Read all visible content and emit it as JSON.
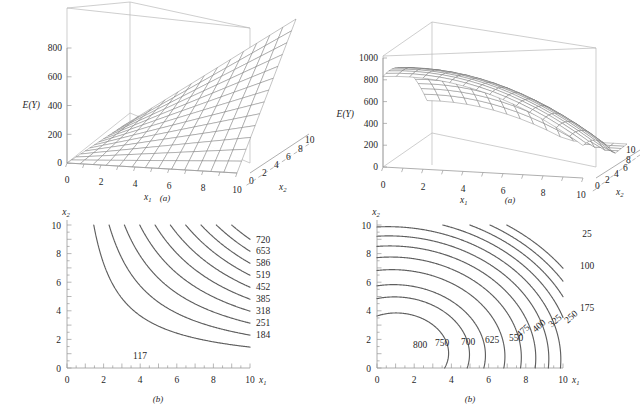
{
  "figure": {
    "panels": [
      {
        "id": "a-left",
        "caption": "(a)",
        "kind": "surface3d",
        "zlabel": "E(Y)",
        "xlabel": "x",
        "xlabel_sub": "1",
        "ylabel": "x",
        "ylabel_sub": "2",
        "zticks": [
          "0",
          "200",
          "400",
          "600",
          "800"
        ],
        "xticks": [
          "0",
          "2",
          "4",
          "6",
          "8",
          "10"
        ],
        "yticks": [
          "0",
          "2",
          "4",
          "6",
          "8",
          "10"
        ]
      },
      {
        "id": "a-right",
        "caption": "(a)",
        "kind": "surface3d",
        "zlabel": "E(Y)",
        "xlabel": "x",
        "xlabel_sub": "1",
        "ylabel": "x",
        "ylabel_sub": "2",
        "zticks": [
          "0",
          "200",
          "400",
          "600",
          "800",
          "1000"
        ],
        "xticks": [
          "0",
          "2",
          "4",
          "6",
          "8",
          "10"
        ],
        "yticks": [
          "0",
          "2",
          "4",
          "6",
          "8",
          "10"
        ]
      },
      {
        "id": "b-left",
        "caption": "(b)",
        "kind": "contour",
        "xlabel": "x",
        "xlabel_sub": "1",
        "ylabel": "x",
        "ylabel_sub": "2",
        "xticks": [
          "0",
          "2",
          "4",
          "6",
          "8",
          "10"
        ],
        "yticks": [
          "0",
          "2",
          "4",
          "6",
          "8",
          "10"
        ]
      },
      {
        "id": "b-right",
        "caption": "(b)",
        "kind": "contour",
        "xlabel": "x",
        "xlabel_sub": "1",
        "ylabel": "x",
        "ylabel_sub": "2",
        "xticks": [
          "0",
          "2",
          "4",
          "6",
          "8",
          "10"
        ],
        "yticks": [
          "0",
          "2",
          "4",
          "6",
          "8",
          "10"
        ]
      }
    ]
  },
  "chart_data": [
    {
      "id": "a-left",
      "type": "surface",
      "title": "",
      "xlabel": "x1",
      "ylabel": "x2",
      "zlabel": "E(Y)",
      "xlim": [
        0,
        10
      ],
      "ylim": [
        0,
        10
      ],
      "zlim": [
        0,
        800
      ],
      "ztick_values": [
        0,
        200,
        400,
        600,
        800
      ],
      "xtick_values": [
        0,
        2,
        4,
        6,
        8,
        10
      ],
      "ytick_values": [
        0,
        2,
        4,
        6,
        8,
        10
      ],
      "surface_description": "Interaction response surface, monotone increasing in both factors, rising to roughly 800 at the far corner (x1=10, x2=10); flat near the origin.",
      "grid": true,
      "legend": "none",
      "mesh_n": 13
    },
    {
      "id": "a-right",
      "type": "surface",
      "title": "",
      "xlabel": "x1",
      "ylabel": "x2",
      "zlabel": "E(Y)",
      "xlim": [
        0,
        10
      ],
      "ylim": [
        0,
        10
      ],
      "zlim": [
        0,
        1000
      ],
      "ztick_values": [
        0,
        200,
        400,
        600,
        800,
        1000
      ],
      "xtick_values": [
        0,
        2,
        4,
        6,
        8,
        10
      ],
      "ytick_values": [
        0,
        2,
        4,
        6,
        8,
        10
      ],
      "surface_description": "Dome-shaped quadratic response surface with maximum near 850 in the low-x1 / low-x2 region, falling off toward larger x1 and x2.",
      "grid": true,
      "legend": "none",
      "mesh_n": 15
    },
    {
      "id": "b-left",
      "type": "contour",
      "title": "",
      "xlabel": "x1",
      "ylabel": "x2",
      "xlim": [
        0,
        10
      ],
      "ylim": [
        0,
        10
      ],
      "xtick_values": [
        0,
        2,
        4,
        6,
        8,
        10
      ],
      "ytick_values": [
        0,
        2,
        4,
        6,
        8,
        10
      ],
      "levels": [
        117,
        184,
        251,
        318,
        385,
        452,
        519,
        586,
        653,
        720
      ],
      "level_step": 67,
      "level_labels": [
        "117",
        "184",
        "251",
        "318",
        "385",
        "452",
        "519",
        "586",
        "653",
        "720"
      ],
      "label_placement": "right edge for 184-720; inline above the curve for 117",
      "contour_shape": "Hyperbolic curves, convex toward the origin, consistent with an interaction (multiplicative) response surface increasing toward the upper-right corner.",
      "grid": false,
      "legend": "none"
    },
    {
      "id": "b-right",
      "type": "contour",
      "title": "",
      "xlabel": "x1",
      "ylabel": "x2",
      "xlim": [
        0,
        10
      ],
      "ylim": [
        0,
        10
      ],
      "xtick_values": [
        0,
        2,
        4,
        6,
        8,
        10
      ],
      "ytick_values": [
        0,
        2,
        4,
        6,
        8,
        10
      ],
      "levels": [
        800,
        750,
        700,
        625,
        550,
        475,
        400,
        325,
        250,
        175,
        100,
        25
      ],
      "level_labels": [
        "800",
        "750",
        "700",
        "625",
        "550",
        "475",
        "400",
        "325",
        "250",
        "175",
        "100",
        "25"
      ],
      "label_placement": "inline along the lower-middle of each curve; 175, 100 and 25 at the right edge",
      "contour_shape": "Nested elliptical/arc contours around a maximum near (x1=1.3, x2=1.3); values decrease outward from 800 down to 25 at the far right.",
      "maximum_at": [
        1.3,
        1.3
      ],
      "grid": false,
      "legend": "none"
    }
  ]
}
